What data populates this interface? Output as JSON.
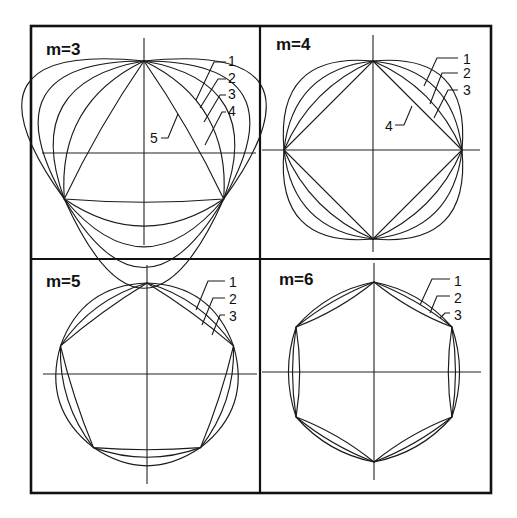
{
  "figure": {
    "panels": [
      {
        "id": "m3",
        "title": "m=3",
        "order": 3,
        "curve_labels": [
          "1",
          "2",
          "3",
          "4",
          "5"
        ],
        "center": [
          144,
          153
        ],
        "radius": 92,
        "rotation_deg": -90,
        "bulges": [
          0.56,
          0.43,
          0.3,
          0.17,
          0.02
        ],
        "axis_h": [
          42,
          256
        ],
        "axis_v": [
          38,
          245
        ],
        "title_pos": [
          46,
          55
        ],
        "labels": [
          {
            "text": "1",
            "x": 228,
            "y": 66,
            "leader": "M196,100 L214,62 L226,62"
          },
          {
            "text": "2",
            "x": 228,
            "y": 83,
            "leader": "M200,108 L218,79 L226,79"
          },
          {
            "text": "3",
            "x": 228,
            "y": 99,
            "leader": "M204,122 L220,95 L226,95"
          },
          {
            "text": "4",
            "x": 228,
            "y": 116,
            "leader": "M205,145 L222,112 L226,112"
          },
          {
            "text": "5",
            "x": 150,
            "y": 143,
            "leader": "M161,138 L168,138 L178,114"
          }
        ]
      },
      {
        "id": "m4",
        "title": "m=4",
        "order": 4,
        "curve_labels": [
          "1",
          "2",
          "3",
          "4"
        ],
        "center": [
          373,
          150
        ],
        "radius": 89,
        "rotation_deg": -90,
        "bulges": [
          0.3,
          0.2,
          0.1,
          0.0
        ],
        "axis_h": [
          262,
          480
        ],
        "axis_v": [
          35,
          252
        ],
        "title_pos": [
          276,
          50
        ],
        "labels": [
          {
            "text": "1",
            "x": 463,
            "y": 64,
            "leader": "M424,86 L437,58 L458,58"
          },
          {
            "text": "2",
            "x": 463,
            "y": 78,
            "leader": "M430,104 L442,73 L458,73"
          },
          {
            "text": "3",
            "x": 463,
            "y": 95,
            "leader": "M434,118 L448,90 L458,90"
          },
          {
            "text": "4",
            "x": 385,
            "y": 131,
            "leader": "M395,125 L404,125 L412,106"
          }
        ]
      },
      {
        "id": "m5",
        "title": "m=5",
        "order": 5,
        "curve_labels": [
          "1",
          "2",
          "3"
        ],
        "center": [
          147,
          374
        ],
        "radius": 91,
        "rotation_deg": -90,
        "bulges": [
          0.17,
          0.09,
          0.02
        ],
        "axis_h": [
          43,
          257
        ],
        "axis_v": [
          265,
          484
        ],
        "title_pos": [
          46,
          287
        ],
        "labels": [
          {
            "text": "1",
            "x": 229,
            "y": 287,
            "leader": "M196,310 L208,281 L225,281"
          },
          {
            "text": "2",
            "x": 229,
            "y": 304,
            "leader": "M202,325 L213,298 L225,298"
          },
          {
            "text": "3",
            "x": 229,
            "y": 321,
            "leader": "M212,335 L220,315 L225,315"
          }
        ]
      },
      {
        "id": "m6",
        "title": "m=6",
        "order": 6,
        "curve_labels": [
          "1",
          "2",
          "3"
        ],
        "center": [
          374,
          372
        ],
        "radius": 90,
        "rotation_deg": -90,
        "bulges": [
          0.085,
          0.04,
          -0.04
        ],
        "axis_h": [
          262,
          481
        ],
        "axis_v": [
          263,
          480
        ],
        "title_pos": [
          279,
          285
        ],
        "labels": [
          {
            "text": "1",
            "x": 454,
            "y": 286,
            "leader": "M420,305 L432,279 L450,279"
          },
          {
            "text": "2",
            "x": 454,
            "y": 303,
            "leader": "M430,313 L437,296 L450,296"
          },
          {
            "text": "3",
            "x": 454,
            "y": 320,
            "leader": "M440,318 L445,313 L450,313"
          }
        ]
      }
    ]
  }
}
